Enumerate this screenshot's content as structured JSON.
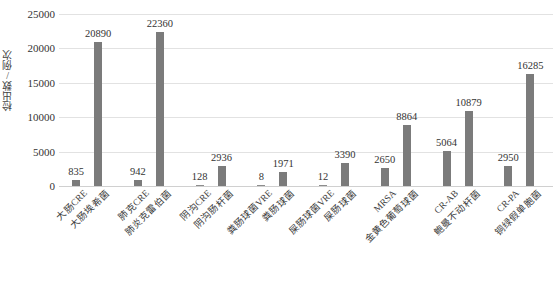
{
  "chart_data": {
    "type": "bar",
    "title": "",
    "xlabel": "",
    "ylabel": "检出数/例次",
    "ylim": [
      0,
      25000
    ],
    "ytick_values": [
      0,
      5000,
      10000,
      15000,
      20000,
      25000
    ],
    "ytick_labels": [
      "0",
      "5000",
      "10000",
      "15000",
      "20000",
      "25000"
    ],
    "grid": true,
    "legend": "none",
    "bar_color": "#7b7b7b",
    "categories": [
      "大肠CRE",
      "大肠埃希菌",
      "肺克CRE",
      "肺炎克雷伯菌",
      "阴沟CRE",
      "阴沟肠杆菌",
      "粪肠球菌VRE",
      "粪肠球菌",
      "屎肠球菌VRE",
      "屎肠球菌",
      "MRSA",
      "金黄色葡萄球菌",
      "CR-AB",
      "鲍曼不动杆菌",
      "CR-PA",
      "铜绿假单胞菌"
    ],
    "values": [
      835,
      20890,
      942,
      22360,
      128,
      2936,
      8,
      1971,
      12,
      3390,
      2650,
      8864,
      5064,
      10879,
      2950,
      16285
    ],
    "value_labels": [
      "835",
      "20890",
      "942",
      "22360",
      "128",
      "2936",
      "8",
      "1971",
      "12",
      "3390",
      "2650",
      "8864",
      "5064",
      "10879",
      "2950",
      "16285"
    ]
  },
  "axis": {
    "y_title": "检出数/例次"
  }
}
